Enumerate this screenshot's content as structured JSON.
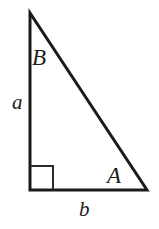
{
  "figure": {
    "name": "right-triangle-diagram",
    "background_color": "#ffffff",
    "stroke_color": "#1b1b1b",
    "width": 159,
    "height": 229
  },
  "geometry": {
    "apex": {
      "x": 30,
      "y": 13
    },
    "right_angle_vertex": {
      "x": 30,
      "y": 190
    },
    "base_right_vertex": {
      "x": 147,
      "y": 190
    },
    "right_angle_marker": {
      "x": 30,
      "y": 166,
      "size": 23
    },
    "stroke_width": 3,
    "marker_stroke_width": 2
  },
  "labels": {
    "angle_B": "B",
    "angle_A": "A",
    "side_a": "a",
    "side_b": "b"
  }
}
